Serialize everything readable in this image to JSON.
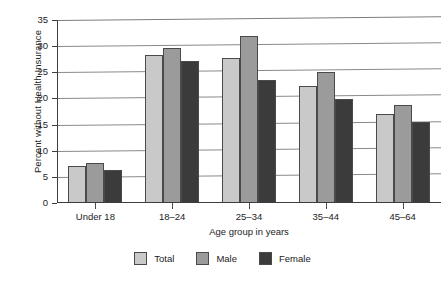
{
  "chart_data": {
    "type": "bar",
    "title": "",
    "subtitle": "",
    "xlabel": "Age group in years",
    "ylabel": "Percent without Health Insurance",
    "categories": [
      "Under 18",
      "18–24",
      "25–34",
      "35–44",
      "45–64"
    ],
    "series": [
      {
        "name": "Total",
        "color": "#c9c9c9",
        "values": [
          7.0,
          28.3,
          27.7,
          22.4,
          17.1
        ]
      },
      {
        "name": "Male",
        "color": "#9b9b9b",
        "values": [
          7.6,
          29.6,
          32.0,
          25.1,
          18.8
        ]
      },
      {
        "name": "Female",
        "color": "#3b3b3b",
        "values": [
          6.4,
          27.2,
          23.6,
          19.9,
          15.5
        ]
      }
    ],
    "ylim": [
      0,
      35
    ],
    "yticks": [
      0,
      5,
      10,
      15,
      20,
      25,
      30,
      35
    ],
    "ytick_labels": [
      "0",
      "5",
      "10",
      "15",
      "20",
      "25",
      "30",
      "35"
    ],
    "grid": true,
    "grid_axis": "y",
    "legend_position": "bottom",
    "bar_group_mode": "grouped"
  },
  "axis": {
    "y_title": "Percent without Health Insurance",
    "x_title": "Age group in years"
  },
  "legend": {
    "entries": [
      {
        "label": "Total",
        "color": "#c9c9c9"
      },
      {
        "label": "Male",
        "color": "#9b9b9b"
      },
      {
        "label": "Female",
        "color": "#3b3b3b"
      }
    ]
  }
}
